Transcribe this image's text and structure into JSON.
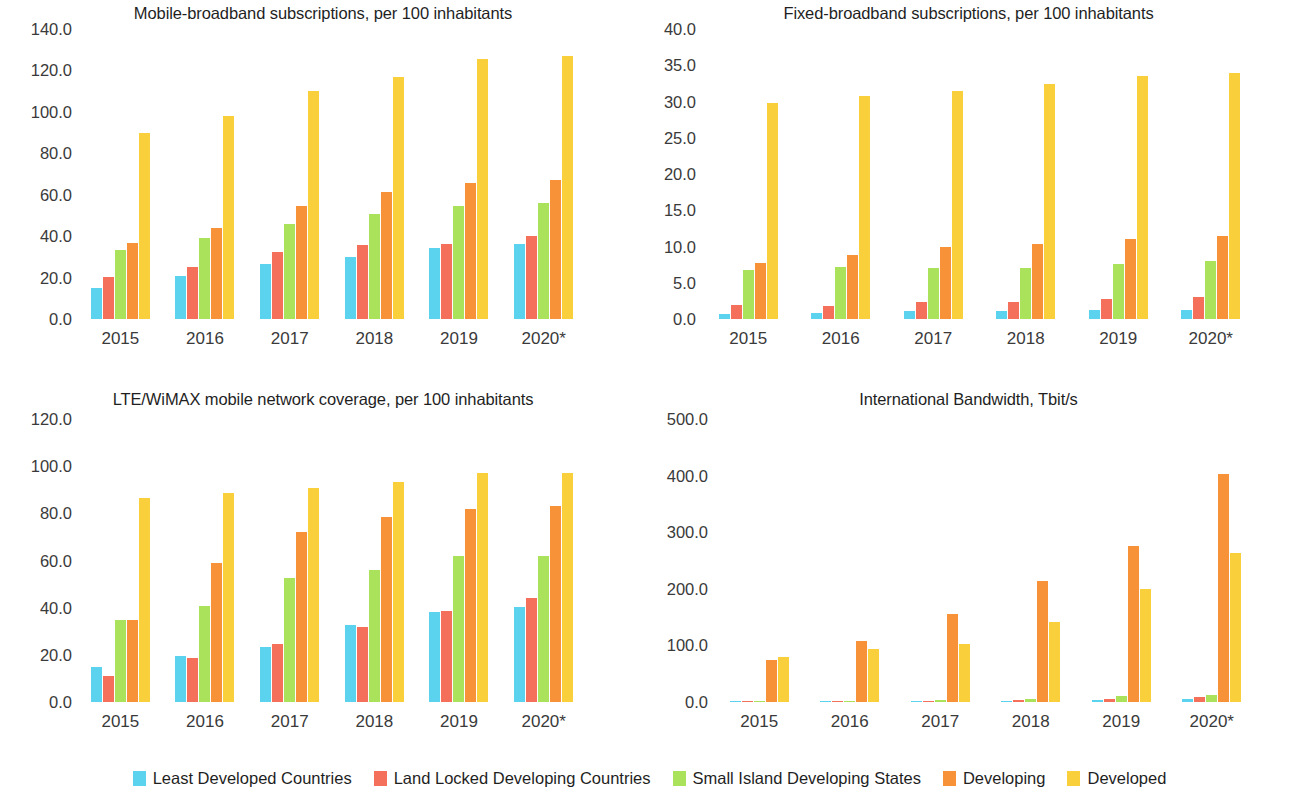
{
  "series_colors": {
    "least_developed": "#5BD3EE",
    "land_locked": "#F4705B",
    "small_island": "#AAE25C",
    "developing": "#F79238",
    "developed": "#FACF3C"
  },
  "legend": {
    "position": "bottom-center",
    "items": [
      {
        "label": "Least Developed Countries",
        "color": "#5BD3EE"
      },
      {
        "label": "Land Locked Developing Countries",
        "color": "#F4705B"
      },
      {
        "label": "Small Island Developing States",
        "color": "#AAE25C"
      },
      {
        "label": "Developing",
        "color": "#F79238"
      },
      {
        "label": "Developed",
        "color": "#FACF3C"
      }
    ]
  },
  "chart_data": [
    {
      "id": "mobile-broadband",
      "type": "bar",
      "title": "Mobile-broadband subscriptions, per 100 inhabitants",
      "xlabel": "",
      "ylabel": "",
      "grid": false,
      "ylim": [
        0,
        140
      ],
      "ytick_step": 20,
      "ytick_labels": [
        "140.0",
        "120.0",
        "100.0",
        "80.0",
        "60.0",
        "40.0",
        "20.0",
        "0.0"
      ],
      "categories": [
        "2015",
        "2016",
        "2017",
        "2018",
        "2019",
        "2020*"
      ],
      "series": [
        {
          "name": "Least Developed Countries",
          "color": "#5BD3EE",
          "values": [
            15.0,
            21.0,
            26.5,
            30.0,
            34.5,
            36.0
          ]
        },
        {
          "name": "Land Locked Developing Countries",
          "color": "#F4705B",
          "values": [
            20.5,
            25.0,
            32.5,
            35.5,
            36.0,
            40.0
          ]
        },
        {
          "name": "Small Island Developing States",
          "color": "#AAE25C",
          "values": [
            33.5,
            39.0,
            46.0,
            50.5,
            54.5,
            56.0
          ]
        },
        {
          "name": "Developing",
          "color": "#F79238",
          "values": [
            36.5,
            44.0,
            54.5,
            61.5,
            65.5,
            67.0
          ]
        },
        {
          "name": "Developed",
          "color": "#FACF3C",
          "values": [
            90.0,
            98.0,
            110.0,
            117.0,
            125.5,
            127.0
          ]
        }
      ]
    },
    {
      "id": "fixed-broadband",
      "type": "bar",
      "title": "Fixed-broadband subscriptions, per 100 inhabitants",
      "xlabel": "",
      "ylabel": "",
      "grid": false,
      "ylim": [
        0,
        40
      ],
      "ytick_step": 5,
      "ytick_labels": [
        "40.0",
        "35.0",
        "30.0",
        "25.0",
        "20.0",
        "15.0",
        "10.0",
        "5.0",
        "0.0"
      ],
      "categories": [
        "2015",
        "2016",
        "2017",
        "2018",
        "2019",
        "2020*"
      ],
      "series": [
        {
          "name": "Least Developed Countries",
          "color": "#5BD3EE",
          "values": [
            0.7,
            0.8,
            1.1,
            1.1,
            1.2,
            1.3
          ]
        },
        {
          "name": "Land Locked Developing Countries",
          "color": "#F4705B",
          "values": [
            1.9,
            1.8,
            2.3,
            2.3,
            2.7,
            3.1
          ]
        },
        {
          "name": "Small Island Developing States",
          "color": "#AAE25C",
          "values": [
            6.8,
            7.2,
            7.1,
            7.1,
            7.6,
            8.0
          ]
        },
        {
          "name": "Developing",
          "color": "#F79238",
          "values": [
            7.7,
            8.8,
            9.9,
            10.3,
            11.1,
            11.5
          ]
        },
        {
          "name": "Developed",
          "color": "#FACF3C",
          "values": [
            29.8,
            30.8,
            31.5,
            32.4,
            33.5,
            34.0
          ]
        }
      ]
    },
    {
      "id": "lte-wimax-coverage",
      "type": "bar",
      "title": "LTE/WiMAX mobile network coverage, per 100 inhabitants",
      "xlabel": "",
      "ylabel": "",
      "grid": false,
      "ylim": [
        0,
        120
      ],
      "ytick_step": 20,
      "ytick_labels": [
        "120.0",
        "100.0",
        "80.0",
        "60.0",
        "40.0",
        "20.0",
        "0.0"
      ],
      "categories": [
        "2015",
        "2016",
        "2017",
        "2018",
        "2019",
        "2020*"
      ],
      "series": [
        {
          "name": "Least Developed Countries",
          "color": "#5BD3EE",
          "values": [
            14.8,
            19.5,
            23.5,
            32.8,
            38.0,
            40.3
          ]
        },
        {
          "name": "Land Locked Developing Countries",
          "color": "#F4705B",
          "values": [
            11.0,
            18.8,
            24.8,
            32.0,
            38.8,
            44.0
          ]
        },
        {
          "name": "Small Island Developing States",
          "color": "#AAE25C",
          "values": [
            34.8,
            40.8,
            52.5,
            56.0,
            61.8,
            61.8
          ]
        },
        {
          "name": "Developing",
          "color": "#F79238",
          "values": [
            34.8,
            59.0,
            72.0,
            78.5,
            82.0,
            83.0
          ]
        },
        {
          "name": "Developed",
          "color": "#FACF3C",
          "values": [
            86.3,
            88.5,
            90.8,
            93.5,
            97.0,
            97.0
          ]
        }
      ]
    },
    {
      "id": "international-bandwidth",
      "type": "bar",
      "title": "International Bandwidth, Tbit/s",
      "xlabel": "",
      "ylabel": "",
      "grid": false,
      "ylim": [
        0,
        500
      ],
      "ytick_step": 100,
      "ytick_labels": [
        "500.0",
        "400.0",
        "300.0",
        "200.0",
        "100.0",
        "0.0"
      ],
      "categories": [
        "2015",
        "2016",
        "2017",
        "2018",
        "2019",
        "2020*"
      ],
      "series": [
        {
          "name": "Least Developed Countries",
          "color": "#5BD3EE",
          "values": [
            0.8,
            1.2,
            1.8,
            2.5,
            3.5,
            4.5
          ]
        },
        {
          "name": "Land Locked Developing Countries",
          "color": "#F4705B",
          "values": [
            1.0,
            1.5,
            2.2,
            3.2,
            4.5,
            8.0
          ]
        },
        {
          "name": "Small Island Developing States",
          "color": "#AAE25C",
          "values": [
            1.2,
            1.8,
            2.8,
            6.0,
            11.5,
            13.0
          ]
        },
        {
          "name": "Developing",
          "color": "#F79238",
          "values": [
            74.0,
            108.0,
            155.0,
            214.0,
            275.0,
            402.0
          ]
        },
        {
          "name": "Developed",
          "color": "#FACF3C",
          "values": [
            79.0,
            93.0,
            103.0,
            142.0,
            200.0,
            263.0
          ]
        }
      ]
    }
  ]
}
